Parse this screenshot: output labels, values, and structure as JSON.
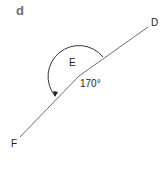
{
  "part": {
    "label": "d"
  },
  "points": {
    "D": {
      "label": "D"
    },
    "E": {
      "label": "E"
    },
    "F": {
      "label": "F"
    }
  },
  "angle": {
    "vertex": "E",
    "value": 170,
    "label": "170°",
    "rays": [
      "ED",
      "EF"
    ],
    "direction": "anticlockwise",
    "type": "reflex-side marking"
  },
  "colors": {
    "line": "#6d6e71",
    "text": "#231f20",
    "part_label": "#6d6e71"
  }
}
